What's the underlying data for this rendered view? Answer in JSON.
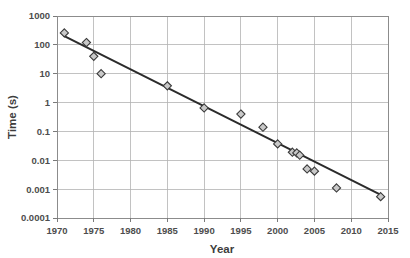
{
  "chart_data": {
    "type": "scatter",
    "title": "",
    "xlabel": "Year",
    "ylabel": "Time (s)",
    "xlim": [
      1970,
      2015
    ],
    "ylim": [
      0.0001,
      1000
    ],
    "yscale": "log",
    "xscale": "linear",
    "grid": true,
    "legend": false,
    "x_ticks": [
      1970,
      1975,
      1980,
      1985,
      1990,
      1995,
      2000,
      2005,
      2010,
      2015
    ],
    "x_tick_labels": [
      "1970",
      "1975",
      "1980",
      "1985",
      "1990",
      "1995",
      "2000",
      "2005",
      "2010",
      "2015"
    ],
    "y_ticks": [
      0.0001,
      0.001,
      0.01,
      0.1,
      1,
      10,
      100,
      1000
    ],
    "y_tick_labels": [
      "0.0001",
      "0.001",
      "0.01",
      "0.1",
      "1",
      "10",
      "100",
      "1000"
    ],
    "series": [
      {
        "name": "Time",
        "marker": "diamond",
        "marker_fill": "#c9c9c9",
        "marker_edge": "#3a3a3a",
        "points": [
          {
            "x": 1971,
            "y": 260
          },
          {
            "x": 1974,
            "y": 120
          },
          {
            "x": 1975,
            "y": 40
          },
          {
            "x": 1976,
            "y": 10
          },
          {
            "x": 1985,
            "y": 3.8
          },
          {
            "x": 1990,
            "y": 0.65
          },
          {
            "x": 1995,
            "y": 0.4
          },
          {
            "x": 1998,
            "y": 0.14
          },
          {
            "x": 2000,
            "y": 0.037
          },
          {
            "x": 2002,
            "y": 0.019
          },
          {
            "x": 2002.6,
            "y": 0.018
          },
          {
            "x": 2003,
            "y": 0.015
          },
          {
            "x": 2004,
            "y": 0.005
          },
          {
            "x": 2005,
            "y": 0.0042
          },
          {
            "x": 2008,
            "y": 0.0011
          },
          {
            "x": 2014,
            "y": 0.00055
          }
        ]
      },
      {
        "name": "trend",
        "type": "line",
        "color": "#2b2b2b",
        "endpoints": [
          {
            "x": 1971,
            "y": 200
          },
          {
            "x": 2014.3,
            "y": 0.00058
          }
        ]
      }
    ]
  }
}
